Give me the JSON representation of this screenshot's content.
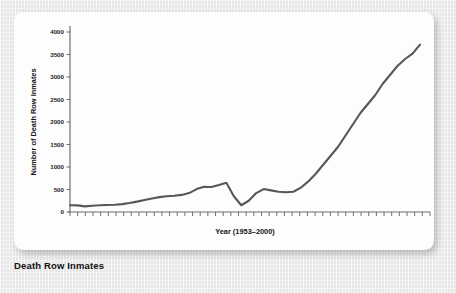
{
  "caption": "Death Row Inmates",
  "chart_data": {
    "type": "line",
    "title": "",
    "xlabel": "Year (1953–2000)",
    "ylabel": "Number of Death Row Inmates",
    "ylim": [
      0,
      4000
    ],
    "ytick_labels": [
      "0",
      "500",
      "1000",
      "1500",
      "2000",
      "2500",
      "3000",
      "3500",
      "4000"
    ],
    "ytick_values": [
      0,
      500,
      1000,
      1500,
      2000,
      2500,
      3000,
      3500,
      4000
    ],
    "xlim": [
      1953,
      2000
    ],
    "grid": false,
    "legend": false,
    "line_color": "#575757",
    "axis_color": "#6e6e6e",
    "x_tick_count": 48,
    "x": [
      1953,
      1954,
      1955,
      1956,
      1957,
      1958,
      1959,
      1960,
      1961,
      1962,
      1963,
      1964,
      1965,
      1966,
      1967,
      1968,
      1969,
      1970,
      1971,
      1972,
      1973,
      1974,
      1975,
      1976,
      1977,
      1978,
      1979,
      1980,
      1981,
      1982,
      1983,
      1984,
      1985,
      1986,
      1987,
      1988,
      1989,
      1990,
      1991,
      1992,
      1993,
      1994,
      1995,
      1996,
      1997,
      1998,
      1999,
      2000
    ],
    "values": [
      150,
      147,
      125,
      140,
      150,
      155,
      160,
      175,
      200,
      230,
      265,
      300,
      330,
      350,
      360,
      380,
      420,
      510,
      560,
      555,
      600,
      650,
      350,
      150,
      250,
      420,
      510,
      480,
      450,
      440,
      450,
      540,
      680,
      850,
      1050,
      1250,
      1450,
      1700,
      1950,
      2200,
      2400,
      2600,
      2850,
      3050,
      3250,
      3400,
      3520,
      3720
    ]
  }
}
